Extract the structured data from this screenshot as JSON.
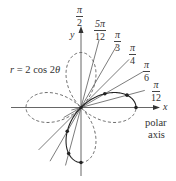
{
  "figure": {
    "equation_label": "r = 2 cos 2θ",
    "equation_parts": {
      "r": "r",
      "rest": " = 2 cos 2",
      "theta": "θ"
    },
    "x_axis_label": "x",
    "y_axis_label": "y",
    "polar_axis_label_line1": "polar",
    "polar_axis_label_line2": "axis",
    "angle_labels": [
      {
        "angle": "π/2",
        "num": "π",
        "den": "2"
      },
      {
        "angle": "5π/12",
        "num": "5π",
        "den": "12"
      },
      {
        "angle": "π/3",
        "num": "π",
        "den": "3"
      },
      {
        "angle": "π/4",
        "num": "π",
        "den": "4"
      },
      {
        "angle": "π/6",
        "num": "π",
        "den": "6"
      },
      {
        "angle": "π/12",
        "num": "π",
        "den": "12"
      }
    ],
    "curve": {
      "equation": "r = 2cos(2θ)",
      "type": "four-leaved rose",
      "solid_segment_theta_range": [
        "0",
        "π/2"
      ],
      "dashed_remainder": true
    },
    "plotted_points": [
      {
        "theta": "0",
        "r": 2
      },
      {
        "theta": "π/12",
        "r": 1.732
      },
      {
        "theta": "π/6",
        "r": 1
      },
      {
        "theta": "π/4",
        "r": 0
      },
      {
        "theta": "π/3",
        "r": -1
      },
      {
        "theta": "5π/12",
        "r": -1.732
      },
      {
        "theta": "π/2",
        "r": -2
      }
    ],
    "colors": {
      "ink": "#333333",
      "background": "#ffffff"
    }
  }
}
